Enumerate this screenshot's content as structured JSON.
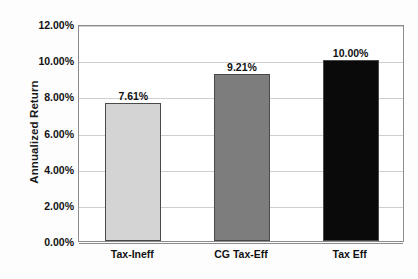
{
  "chart_data": {
    "type": "bar",
    "title": "",
    "subtitle": "",
    "xlabel": "",
    "ylabel": "Annualized Return",
    "categories": [
      "Tax-Ineff",
      "CG Tax-Eff",
      "Tax Eff"
    ],
    "values": [
      7.61,
      9.21,
      10.0
    ],
    "data_labels": [
      "7.61%",
      "9.21%",
      "10.00%"
    ],
    "bar_colors": [
      "#d4d4d4",
      "#7d7d7d",
      "#0a0a0a"
    ],
    "bar_border_color": "#4a4a4a",
    "ylim": [
      0,
      12
    ],
    "ytick_values": [
      0,
      2,
      4,
      6,
      8,
      10,
      12
    ],
    "ytick_labels": [
      "0.00%",
      "2.00%",
      "4.00%",
      "6.00%",
      "8.00%",
      "10.00%",
      "12.00%"
    ],
    "grid": true,
    "grid_axis": "y",
    "legend": false,
    "legend_position": "none",
    "plot_background": "#ffffff",
    "grid_color": "#cfcfcf",
    "axis_color": "#8c8c8c"
  }
}
